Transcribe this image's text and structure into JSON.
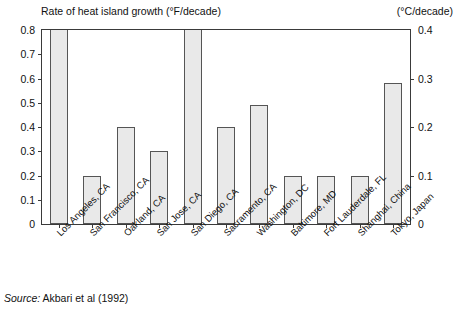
{
  "chart_data": {
    "type": "bar",
    "title": "Rate of heat island growth (°F/decade)",
    "xlabel": "",
    "ylabel": "Rate of heat island growth (°F/decade)",
    "ylabel_right": "(°C/decade)",
    "ylim": [
      0,
      0.8
    ],
    "ylim_right": [
      0,
      0.4
    ],
    "yticks": [
      "0",
      "0.1",
      "0.2",
      "0.3",
      "0.4",
      "0.5",
      "0.6",
      "0.7",
      "0.8"
    ],
    "ytickvalues": [
      0,
      0.1,
      0.2,
      0.3,
      0.4,
      0.5,
      0.6,
      0.7,
      0.8
    ],
    "yticks_right": [
      "0",
      "0.1",
      "0.2",
      "0.3",
      "0.4"
    ],
    "ytickvalues_right": [
      0,
      0.1,
      0.2,
      0.3,
      0.4
    ],
    "grid": false,
    "legend": "none",
    "categories": [
      "Los Angeles, CA",
      "San Francisco, CA",
      "Oakland, CA",
      "San Jose, CA",
      "San Diego, CA",
      "Sacramento, CA",
      "Washington, DC",
      "Baltimore, MD",
      "Fort Lauderdale, FL",
      "Shanghai, China",
      "Tokyo, Japan"
    ],
    "values": [
      0.8,
      0.2,
      0.4,
      0.3,
      0.8,
      0.4,
      0.49,
      0.2,
      0.2,
      0.2,
      0.58
    ],
    "clipped": [
      true,
      false,
      false,
      false,
      true,
      false,
      false,
      false,
      false,
      false,
      false
    ],
    "note": "Bars for Los Angeles, CA and San Diego, CA extend beyond the top of the 0.8 axis"
  },
  "footer": {
    "source_word": "Source:",
    "source_text": " Akbari et al (1992)"
  },
  "colors": {
    "bar_fill": "#e9e9e9",
    "bar_border": "#555555",
    "axis": "#3a3a3a",
    "text": "#111111",
    "background": "#ffffff"
  }
}
